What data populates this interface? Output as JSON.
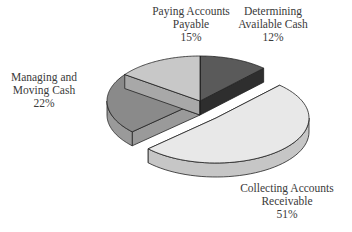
{
  "chart_data": {
    "type": "pie",
    "style": "3d-exploded",
    "title": "",
    "categories": [
      "Determining Available Cash",
      "Collecting Accounts Receivable",
      "Managing and Moving Cash",
      "Paying Accounts Payable"
    ],
    "values": [
      12,
      51,
      22,
      15
    ],
    "unit": "%",
    "exploded": [
      "Collecting Accounts Receivable"
    ],
    "colors": {
      "Determining Available Cash": "#5a5a5a",
      "Collecting Accounts Receivable": "#e8e8e8",
      "Managing and Moving Cash": "#8a8a8a",
      "Paying Accounts Payable": "#c8c8c8"
    },
    "side_colors": {
      "Determining Available Cash": "#2e2e2e",
      "Collecting Accounts Receivable": "#c6c6c6",
      "Managing and Moving Cash": "#9a9a9a",
      "Paying Accounts Payable": "#a8a8a8"
    },
    "legend": "none",
    "labels": [
      {
        "lines": [
          "Paying Accounts",
          "Payable",
          "15%"
        ]
      },
      {
        "lines": [
          "Determining",
          "Available Cash",
          "12%"
        ]
      },
      {
        "lines": [
          "Managing and",
          "Moving Cash",
          "22%"
        ]
      },
      {
        "lines": [
          "Collecting Accounts",
          "Receivable",
          "51%"
        ]
      }
    ]
  }
}
